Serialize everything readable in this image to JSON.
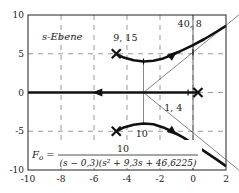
{
  "chart_data": {
    "type": "line",
    "title": "",
    "plot_label": "s-Ebene",
    "xlabel": "",
    "ylabel": "",
    "xlim": [
      -10,
      2
    ],
    "ylim": [
      -10,
      10
    ],
    "xticks": [
      -10,
      -8,
      -6,
      -4,
      -2,
      0,
      2
    ],
    "yticks": [
      -10,
      -5,
      0,
      5,
      10
    ],
    "grid": "dashed",
    "transfer_function": {
      "lhs": "F",
      "lhs_sub": "o",
      "numerator": "10",
      "denominator": "(s − 0,3)(s² + 9,3s + 46,6225)"
    },
    "poles": [
      {
        "re": 0.3,
        "im": 0
      },
      {
        "re": -4.65,
        "im": 5
      },
      {
        "re": -4.65,
        "im": -5
      }
    ],
    "asymptote_center": {
      "re": -3,
      "im": 0
    },
    "asymptote_angles_deg": [
      60,
      180,
      -60
    ],
    "annotations": [
      {
        "text": "9, 15",
        "re": -3.0,
        "im": 4.0,
        "label_re": -4.1,
        "label_im": 6.6
      },
      {
        "text": "40, 8",
        "re": 0.0,
        "im": 5.2,
        "label_re": -0.2,
        "label_im": 8.4
      },
      {
        "text": "1, 4",
        "re": -0.3,
        "im": 0,
        "label_re": -1.2,
        "label_im": -2.4
      },
      {
        "text": "10",
        "re": -3.0,
        "im": -4.0,
        "label_re": -3.1,
        "label_im": -5.8
      }
    ],
    "series": [
      {
        "name": "branch-real-axis",
        "points": [
          [
            0.3,
            0
          ],
          [
            -10,
            0
          ]
        ]
      },
      {
        "name": "branch-upper",
        "points": [
          [
            -4.65,
            5
          ],
          [
            -4.2,
            4.5
          ],
          [
            -3.6,
            4.15
          ],
          [
            -3.0,
            4.0
          ],
          [
            -2.4,
            4.1
          ],
          [
            -1.8,
            4.4
          ],
          [
            -1.2,
            4.9
          ],
          [
            -0.6,
            5.5
          ],
          [
            0,
            6.1
          ],
          [
            0.7,
            6.9
          ],
          [
            1.4,
            7.8
          ],
          [
            2,
            8.6
          ]
        ]
      },
      {
        "name": "branch-lower",
        "points": [
          [
            -4.65,
            -5
          ],
          [
            -4.2,
            -4.5
          ],
          [
            -3.6,
            -4.15
          ],
          [
            -3.0,
            -4.0
          ],
          [
            -2.4,
            -4.1
          ],
          [
            -1.8,
            -4.5
          ],
          [
            -1.2,
            -5.1
          ],
          [
            -0.6,
            -5.8
          ],
          [
            0,
            -6.6
          ],
          [
            0.7,
            -7.6
          ],
          [
            1.4,
            -8.6
          ],
          [
            2,
            -9.5
          ]
        ]
      }
    ],
    "colors": {
      "locus": "#111111",
      "axes": "#222222",
      "grid": "#555555",
      "asymptote": "#333333"
    }
  }
}
